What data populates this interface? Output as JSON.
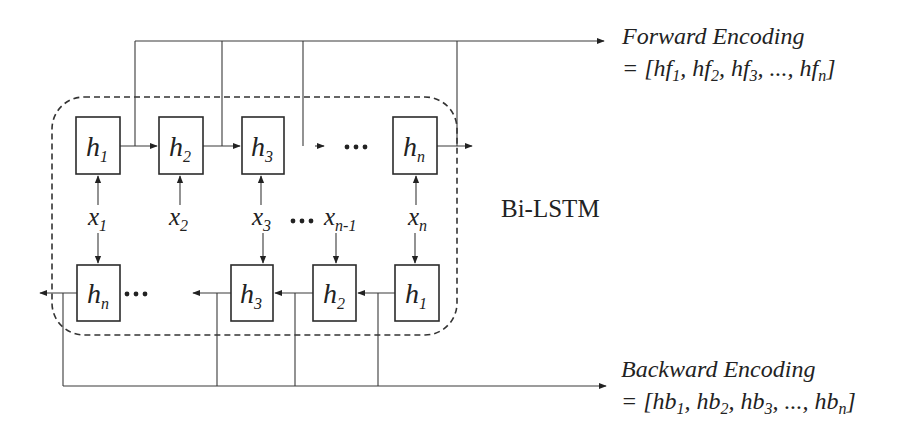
{
  "diagram": {
    "title": "Bi-LSTM",
    "forward_row": {
      "cells": [
        {
          "base": "h",
          "sub": "1"
        },
        {
          "base": "h",
          "sub": "2"
        },
        {
          "base": "h",
          "sub": "3"
        },
        {
          "base": "h",
          "sub": "n"
        }
      ],
      "ellipsis": "•••"
    },
    "backward_row": {
      "cells": [
        {
          "base": "h",
          "sub": "n"
        },
        {
          "base": "h",
          "sub": "3"
        },
        {
          "base": "h",
          "sub": "2"
        },
        {
          "base": "h",
          "sub": "1"
        }
      ],
      "ellipsis": "•••"
    },
    "inputs": [
      {
        "base": "x",
        "sub": "1"
      },
      {
        "base": "x",
        "sub": "2"
      },
      {
        "base": "x",
        "sub": "3"
      },
      {
        "base": "x",
        "sub": "n-1"
      },
      {
        "base": "x",
        "sub": "n"
      }
    ],
    "input_ellipsis": "•••",
    "forward_output": {
      "title": "Forward Encoding",
      "prefix": "= [",
      "items": [
        {
          "base": "hf",
          "sub": "1"
        },
        {
          "base": "hf",
          "sub": "2"
        },
        {
          "base": "hf",
          "sub": "3"
        },
        {
          "base": "hf",
          "sub": "n"
        }
      ],
      "ellipsis": "...",
      "suffix": "]"
    },
    "backward_output": {
      "title": "Backward Encoding",
      "prefix": "= [",
      "items": [
        {
          "base": "hb",
          "sub": "1"
        },
        {
          "base": "hb",
          "sub": "2"
        },
        {
          "base": "hb",
          "sub": "3"
        },
        {
          "base": "hb",
          "sub": "n"
        }
      ],
      "ellipsis": "...",
      "suffix": "]"
    }
  }
}
